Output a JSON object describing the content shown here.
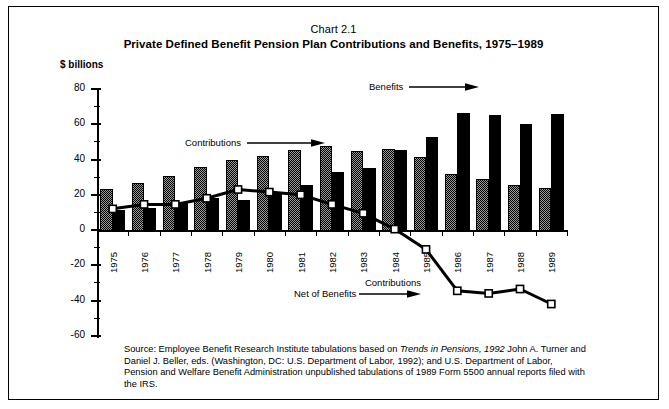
{
  "chart_data": {
    "type": "bar",
    "title": "Chart 2.1",
    "subtitle": "Private Defined Benefit Pension Plan Contributions and Benefits, 1975–1989",
    "ylabel": "$ billions",
    "xlabel": "",
    "ylim": [
      -60,
      80
    ],
    "yticks": [
      80,
      60,
      40,
      20,
      0,
      -20,
      -40,
      -60
    ],
    "grid": false,
    "legend": "annotations",
    "categories": [
      "1975",
      "1976",
      "1977",
      "1978",
      "1979",
      "1980",
      "1981",
      "1982",
      "1983",
      "1984",
      "1985",
      "1986",
      "1987",
      "1988",
      "1989"
    ],
    "series": [
      {
        "name": "Contributions",
        "type": "bar",
        "values": [
          24,
          27.5,
          31,
          36.5,
          40.5,
          42.5,
          46,
          48,
          45.5,
          46.5,
          42,
          32.5,
          29.5,
          26,
          24.5
        ]
      },
      {
        "name": "Benefits",
        "type": "bar",
        "values": [
          12,
          13,
          16.5,
          18.5,
          17.5,
          21,
          26,
          33.5,
          36,
          46,
          53.5,
          67,
          66,
          60.5,
          66.5
        ]
      },
      {
        "name": "Contributions Net of Benefits",
        "type": "line",
        "values": [
          12,
          14.5,
          14.5,
          18,
          23,
          21.5,
          20,
          14.5,
          9.5,
          0.5,
          -11,
          -34.5,
          -36,
          -33.5,
          -42
        ]
      }
    ],
    "annotations": [
      {
        "label": "Contributions",
        "target": "contributions-bars"
      },
      {
        "label": "Benefits",
        "target": "benefits-bars"
      },
      {
        "label": "Contributions\nNet of Benefits",
        "line1": "Contributions",
        "line2": "Net of Benefits",
        "target": "net-line"
      }
    ]
  },
  "header": {
    "chart_number": "Chart 2.1",
    "title": "Private Defined Benefit Pension Plan Contributions and Benefits, 1975–1989"
  },
  "axis": {
    "unit_label": "$ billions",
    "y_labels": [
      "80",
      "60",
      "40",
      "20",
      "0",
      "-20",
      "-40",
      "-60"
    ],
    "x_labels": [
      "1975",
      "1976",
      "1977",
      "1978",
      "1979",
      "1980",
      "1981",
      "1982",
      "1983",
      "1984",
      "1985",
      "1986",
      "1987",
      "1988",
      "1989"
    ]
  },
  "annotations": {
    "contributions": "Contributions",
    "benefits": "Benefits",
    "net_line1": "Contributions",
    "net_line2": "Net of Benefits"
  },
  "source": {
    "part1": "Source: Employee Benefit Research Institute tabulations based on ",
    "italic1": "Trends in Pensions, 1992",
    "part2": "  John A. Turner and Daniel J. Beller, eds.  (Washington, DC:  U.S. Department of Labor, 1992); and U.S. Department of Labor, Pension and Welfare Benefit Administration unpublished tabulations of 1989 Form 5500 annual reports filed with the IRS."
  },
  "colors": {
    "contributions_fill": "#9a9a9a",
    "benefits_fill": "#000000",
    "line_color": "#000000",
    "marker_fill": "#ffffff",
    "frame": "#000000"
  }
}
